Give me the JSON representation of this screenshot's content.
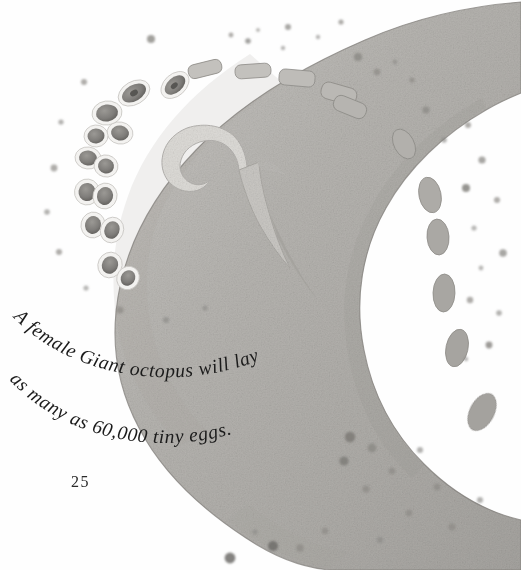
{
  "page": {
    "number": "25",
    "background_color": "#ffffff"
  },
  "caption": {
    "line1": "A female Giant octopus will lay",
    "line2": "as many as 60,000 tiny eggs.",
    "full_text": "A female Giant octopus will lay as many as 60,000 tiny eggs.",
    "text_color": "#1b1b1b"
  },
  "illustration": {
    "name": "giant-octopus-tentacle-spiral",
    "description": "Watercolor spiral of a giant octopus arm with a double row of suckers along its inner edge and speckled skin",
    "colors": {
      "arm_fill": "#b4b2ae",
      "arm_fill_light": "#c8c6c2",
      "arm_fill_dark": "#9d9b97",
      "arm_outline": "#7c7a76",
      "sucker_rim": "#f4f3f1",
      "sucker_body": "#8b8985",
      "sucker_center": "#5e5c59",
      "speckle": "#8c8a86",
      "speckle_dark": "#6f6d6a"
    },
    "sucker_count_visible": 18,
    "speckle_count_visible": 46
  }
}
